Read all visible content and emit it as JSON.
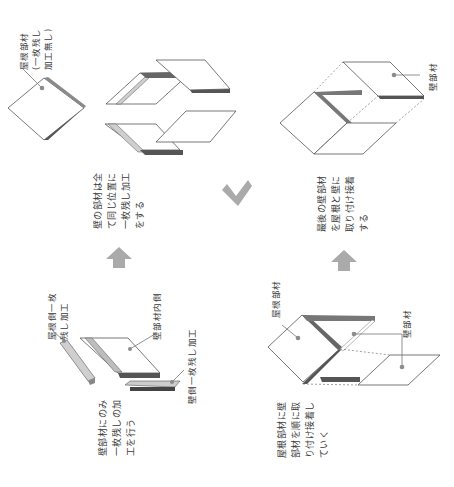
{
  "diagram": {
    "orientation": "rotated-90-ccw",
    "colors": {
      "panel_fill": "#ffffff",
      "outline": "#555555",
      "dark_edge": "#5a5a5a",
      "light_edge": "#bdbdbd",
      "arrow": "#aaaaaa",
      "leader_dot": "#8c8c8c"
    },
    "steps": [
      {
        "id": "step1",
        "description_lines": [
          "壁部材にのみ",
          "一枚残しの加",
          "工を行う"
        ],
        "callouts": [
          {
            "lines": [
              "屋根側一枚",
              "残し加工"
            ]
          },
          {
            "lines": [
              "壁部材内側"
            ]
          },
          {
            "lines": [
              "壁側一枚残し加工"
            ]
          }
        ]
      },
      {
        "id": "step2",
        "description_lines": [
          "壁の部材は全",
          "て同じ位置に",
          "一枚残し加工",
          "をする"
        ],
        "callouts": [
          {
            "lines": [
              "屋根部材",
              "(一枚残し",
              "加工無し)"
            ]
          }
        ]
      },
      {
        "id": "step3",
        "description_lines": [
          "屋根部材に壁",
          "部材を順に取",
          "り付け接着し",
          "ていく"
        ],
        "callouts": [
          {
            "lines": [
              "屋根部材"
            ]
          },
          {
            "lines": [
              "壁部材"
            ]
          }
        ]
      },
      {
        "id": "step4",
        "description_lines": [
          "最後の壁部材",
          "を屋根と壁に",
          "取り付け接着",
          "する"
        ],
        "callouts": [
          {
            "lines": [
              "壁部材"
            ]
          }
        ]
      }
    ],
    "arrows": [
      {
        "from": "step1",
        "to": "step2",
        "icon": "arrow-up-icon"
      },
      {
        "from": "step2",
        "to": "step3",
        "icon": "arrow-diagonal-icon"
      },
      {
        "from": "step3",
        "to": "step4",
        "icon": "arrow-up-icon"
      }
    ]
  }
}
